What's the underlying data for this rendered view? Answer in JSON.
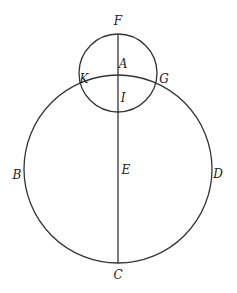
{
  "diagram": {
    "type": "geometry",
    "stroke_color": "#333333",
    "small_circle": {
      "cx": 118,
      "cy": 73,
      "r": 39
    },
    "large_circle": {
      "cx": 118,
      "cy": 169,
      "r": 94
    },
    "line": {
      "x": 118,
      "y1": 34,
      "y2": 263
    },
    "labels": {
      "F": "F",
      "A": "A",
      "K": "K",
      "G": "G",
      "I": "I",
      "B": "B",
      "E": "E",
      "D": "D",
      "C": "C"
    }
  }
}
